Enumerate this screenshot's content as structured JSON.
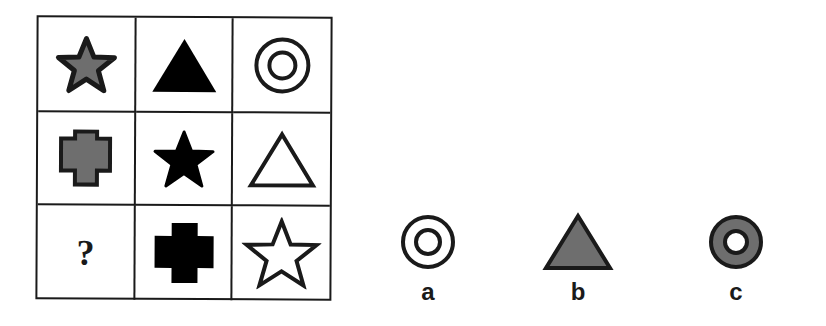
{
  "puzzle": {
    "grid": [
      [
        {
          "shape": "star",
          "fill": "gray",
          "icon": "star-gray-icon"
        },
        {
          "shape": "triangle",
          "fill": "black",
          "icon": "triangle-black-icon"
        },
        {
          "shape": "double-circle",
          "fill": "white",
          "icon": "double-circle-white-icon"
        }
      ],
      [
        {
          "shape": "cross",
          "fill": "gray",
          "icon": "cross-gray-icon"
        },
        {
          "shape": "star",
          "fill": "black",
          "icon": "star-black-icon"
        },
        {
          "shape": "triangle",
          "fill": "white",
          "icon": "triangle-white-icon"
        }
      ],
      [
        {
          "shape": "unknown",
          "text": "?",
          "icon": "question-mark"
        },
        {
          "shape": "cross",
          "fill": "black",
          "icon": "cross-black-icon"
        },
        {
          "shape": "star",
          "fill": "white",
          "icon": "star-white-icon"
        }
      ]
    ],
    "missing_label": "?"
  },
  "options": [
    {
      "label": "a",
      "shape": "double-circle",
      "fill": "white",
      "icon": "double-circle-white-icon"
    },
    {
      "label": "b",
      "shape": "triangle",
      "fill": "gray",
      "icon": "triangle-gray-icon"
    },
    {
      "label": "c",
      "shape": "ring",
      "fill": "gray",
      "icon": "ring-gray-icon"
    }
  ],
  "colors": {
    "outline": "#1a1a1a",
    "gray_fill": "#6e6e6e",
    "black_fill": "#000000",
    "white_fill": "#ffffff"
  }
}
